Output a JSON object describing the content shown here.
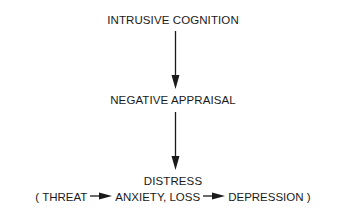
{
  "diagram": {
    "type": "flowchart",
    "direction": "top-to-bottom",
    "nodes": [
      {
        "id": "n1",
        "label": "INTRUSIVE COGNITION"
      },
      {
        "id": "n2",
        "label": "NEGATIVE APPRAISAL"
      },
      {
        "id": "n3",
        "label": "DISTRESS"
      }
    ],
    "edges": [
      {
        "from": "n1",
        "to": "n2"
      },
      {
        "from": "n2",
        "to": "n3"
      }
    ],
    "distress_detail": {
      "open_paren": "(",
      "item1": "THREAT",
      "item2": "ANXIETY, LOSS",
      "item3": "DEPRESSION",
      "close_paren": ")"
    }
  }
}
